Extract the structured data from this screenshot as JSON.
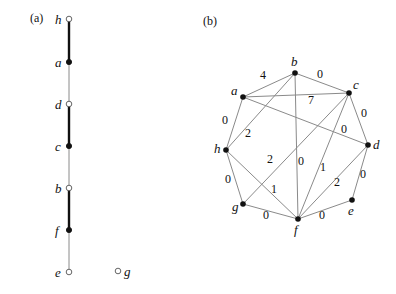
{
  "panel_a": {
    "label": "(a)",
    "label_pos": [
      30,
      22
    ],
    "nodes": [
      {
        "id": "h",
        "x": 69,
        "y": 19,
        "filled": false
      },
      {
        "id": "a",
        "x": 69,
        "y": 62,
        "filled": true
      },
      {
        "id": "d",
        "x": 69,
        "y": 104,
        "filled": false
      },
      {
        "id": "c",
        "x": 69,
        "y": 146,
        "filled": true
      },
      {
        "id": "b",
        "x": 69,
        "y": 188,
        "filled": false
      },
      {
        "id": "f",
        "x": 69,
        "y": 230,
        "filled": true
      },
      {
        "id": "e",
        "x": 69,
        "y": 272,
        "filled": false
      },
      {
        "id": "g",
        "x": 118,
        "y": 271,
        "filled": false
      }
    ],
    "edges": [
      {
        "from": "h",
        "to": "a",
        "bold": true
      },
      {
        "from": "a",
        "to": "d",
        "bold": false
      },
      {
        "from": "d",
        "to": "c",
        "bold": true
      },
      {
        "from": "c",
        "to": "b",
        "bold": false
      },
      {
        "from": "b",
        "to": "f",
        "bold": true
      },
      {
        "from": "f",
        "to": "e",
        "bold": false
      }
    ]
  },
  "panel_b": {
    "label": "(b)",
    "label_pos": [
      203,
      25
    ],
    "nodes": [
      {
        "id": "b",
        "x": 295,
        "y": 73,
        "lx": 291,
        "ly": 66
      },
      {
        "id": "a",
        "x": 243,
        "y": 97,
        "lx": 231,
        "ly": 95
      },
      {
        "id": "c",
        "x": 349,
        "y": 93,
        "lx": 353,
        "ly": 89
      },
      {
        "id": "h",
        "x": 226,
        "y": 150,
        "lx": 214,
        "ly": 153
      },
      {
        "id": "d",
        "x": 368,
        "y": 145,
        "lx": 373,
        "ly": 149
      },
      {
        "id": "g",
        "x": 243,
        "y": 204,
        "lx": 232,
        "ly": 211
      },
      {
        "id": "e",
        "x": 352,
        "y": 200,
        "lx": 348,
        "ly": 215
      },
      {
        "id": "f",
        "x": 298,
        "y": 219,
        "lx": 294,
        "ly": 234
      }
    ],
    "edges": [
      {
        "from": "a",
        "to": "b",
        "weight": "4",
        "wx": 263,
        "wy": 79
      },
      {
        "from": "b",
        "to": "c",
        "weight": "0",
        "wx": 320,
        "wy": 78
      },
      {
        "from": "a",
        "to": "c",
        "weight": "7",
        "wx": 311,
        "wy": 104
      },
      {
        "from": "a",
        "to": "h",
        "weight": "0",
        "wx": 225,
        "wy": 124
      },
      {
        "from": "h",
        "to": "b",
        "weight": "2",
        "wx": 248,
        "wy": 137
      },
      {
        "from": "a",
        "to": "d",
        "weight": "0",
        "wx": 344,
        "wy": 133
      },
      {
        "from": "c",
        "to": "d",
        "weight": "0",
        "wx": 364,
        "wy": 117
      },
      {
        "from": "b",
        "to": "f",
        "weight": "0",
        "wx": 301,
        "wy": 165
      },
      {
        "from": "c",
        "to": "g",
        "weight": "2",
        "wx": 270,
        "wy": 163
      },
      {
        "from": "c",
        "to": "f",
        "weight": "1",
        "wx": 323,
        "wy": 171
      },
      {
        "from": "h",
        "to": "g",
        "weight": "0",
        "wx": 228,
        "wy": 183
      },
      {
        "from": "h",
        "to": "f",
        "weight": "1",
        "wx": 274,
        "wy": 193
      },
      {
        "from": "d",
        "to": "e",
        "weight": "0",
        "wx": 363,
        "wy": 178
      },
      {
        "from": "d",
        "to": "f",
        "weight": "2",
        "wx": 337,
        "wy": 186
      },
      {
        "from": "g",
        "to": "f",
        "weight": "0",
        "wx": 266,
        "wy": 219
      },
      {
        "from": "f",
        "to": "e",
        "weight": "0",
        "wx": 322,
        "wy": 219
      }
    ]
  },
  "colors": {
    "node_fill": "#111111",
    "edge_gray": "#8a8a8a",
    "edge_bold": "#111111",
    "background": "#ffffff"
  }
}
